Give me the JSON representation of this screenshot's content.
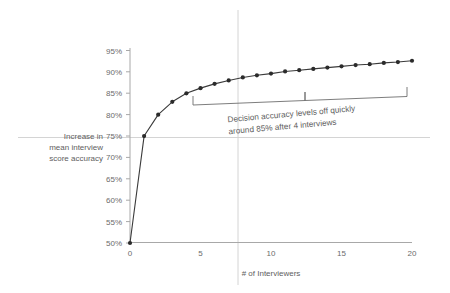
{
  "chart_data": {
    "type": "line",
    "title": "",
    "xlabel": "# of Interviewers",
    "ylabel": "Increase in mean interview score accuracy",
    "ylabel_lines": [
      "Increase in",
      "mean interview",
      "score accuracy"
    ],
    "x": [
      0,
      1,
      2,
      3,
      4,
      5,
      6,
      7,
      8,
      9,
      10,
      11,
      12,
      13,
      14,
      15,
      16,
      17,
      18,
      19,
      20
    ],
    "values": [
      50,
      75,
      80,
      83,
      85,
      86.2,
      87.2,
      88,
      88.7,
      89.2,
      89.6,
      90.1,
      90.4,
      90.7,
      91,
      91.3,
      91.6,
      91.8,
      92.1,
      92.3,
      92.6
    ],
    "series": [
      {
        "name": "Mean interview score accuracy",
        "values": [
          50,
          75,
          80,
          83,
          85,
          86.2,
          87.2,
          88,
          88.7,
          89.2,
          89.6,
          90.1,
          90.4,
          90.7,
          91,
          91.3,
          91.6,
          91.8,
          92.1,
          92.3,
          92.6
        ]
      }
    ],
    "xlim": [
      0,
      20
    ],
    "ylim": [
      50,
      95
    ],
    "xticks": [
      0,
      5,
      10,
      15,
      20
    ],
    "xtick_labels": [
      "0",
      "5",
      "10",
      "15",
      "20"
    ],
    "yticks": [
      50,
      55,
      60,
      65,
      70,
      75,
      80,
      85,
      90,
      95
    ],
    "ytick_labels": [
      "50%",
      "55%",
      "60%",
      "65%",
      "70%",
      "75%",
      "80%",
      "85%",
      "90%",
      "95%"
    ],
    "grid": false,
    "legend": "none",
    "marker": "circle",
    "line_color": "#3a3a3a",
    "marker_color": "#2b2b2b",
    "axis_color": "#9a9a9a",
    "guide_color": "#c9c9c9",
    "annotations": [
      {
        "name": "leveling-off-callout",
        "text_lines": [
          "Decision accuracy levels off quickly",
          "around 85% after 4 interviews"
        ],
        "text": "Decision accuracy levels off quickly around 85% after 4 interviews",
        "bracket_x_start": 5,
        "bracket_x_end": 20
      }
    ]
  },
  "axes": {
    "x_title": "# of Interviewers",
    "y_title_lines": [
      "Increase in",
      "mean interview",
      "score accuracy"
    ]
  }
}
